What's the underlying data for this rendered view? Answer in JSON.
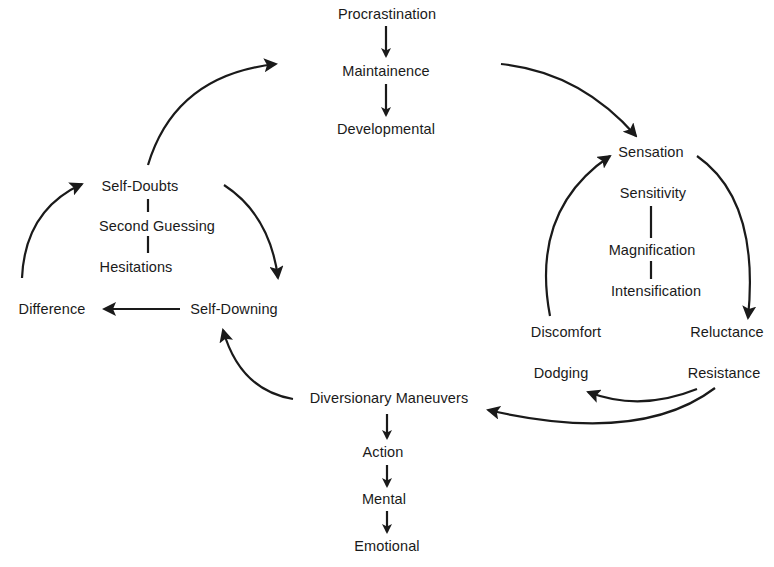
{
  "diagram": {
    "nodes": {
      "procrastination": "Procrastination",
      "maintainence": "Maintainence",
      "developmental": "Developmental",
      "sensation": "Sensation",
      "sensitivity": "Sensitivity",
      "magnification": "Magnification",
      "intensification": "Intensification",
      "discomfort": "Discomfort",
      "reluctance": "Reluctance",
      "dodging": "Dodging",
      "resistance": "Resistance",
      "diversionary_maneuvers": "Diversionary Maneuvers",
      "action": "Action",
      "mental": "Mental",
      "emotional": "Emotional",
      "self_downing": "Self-Downing",
      "difference": "Difference",
      "self_doubts": "Self-Doubts",
      "second_guessing": "Second Guessing",
      "hesitations": "Hesitations"
    },
    "edges": [
      {
        "from": "Procrastination",
        "to": "Maintainence",
        "type": "arrow"
      },
      {
        "from": "Maintainence",
        "to": "Developmental",
        "type": "arrow"
      },
      {
        "from": "Maintainence",
        "to": "Sensation",
        "type": "curved-arrow"
      },
      {
        "from": "Sensation",
        "to": "Reluctance",
        "type": "curved-arrow"
      },
      {
        "from": "Discomfort",
        "to": "Sensation",
        "type": "curved-arrow"
      },
      {
        "from": "Sensitivity",
        "to": "Magnification",
        "type": "line"
      },
      {
        "from": "Magnification",
        "to": "Intensification",
        "type": "line"
      },
      {
        "from": "Resistance",
        "to": "Dodging",
        "type": "curved-arrow"
      },
      {
        "from": "Resistance",
        "to": "Diversionary Maneuvers",
        "type": "curved-arrow"
      },
      {
        "from": "Diversionary Maneuvers",
        "to": "Action",
        "type": "arrow"
      },
      {
        "from": "Action",
        "to": "Mental",
        "type": "arrow"
      },
      {
        "from": "Mental",
        "to": "Emotional",
        "type": "arrow"
      },
      {
        "from": "Diversionary Maneuvers",
        "to": "Self-Downing",
        "type": "curved-arrow"
      },
      {
        "from": "Self-Downing",
        "to": "Difference",
        "type": "arrow"
      },
      {
        "from": "Difference",
        "to": "Self-Doubts",
        "type": "curved-arrow"
      },
      {
        "from": "Self-Doubts",
        "to": "Second Guessing",
        "type": "line"
      },
      {
        "from": "Second Guessing",
        "to": "Hesitations",
        "type": "line"
      },
      {
        "from": "Self-Doubts",
        "to": "Self-Downing",
        "type": "curved-arrow"
      },
      {
        "from": "Self-Doubts",
        "to": "Maintainence",
        "type": "curved-arrow"
      }
    ],
    "colors": {
      "ink": "#1a1a1a",
      "background": "#ffffff"
    }
  }
}
